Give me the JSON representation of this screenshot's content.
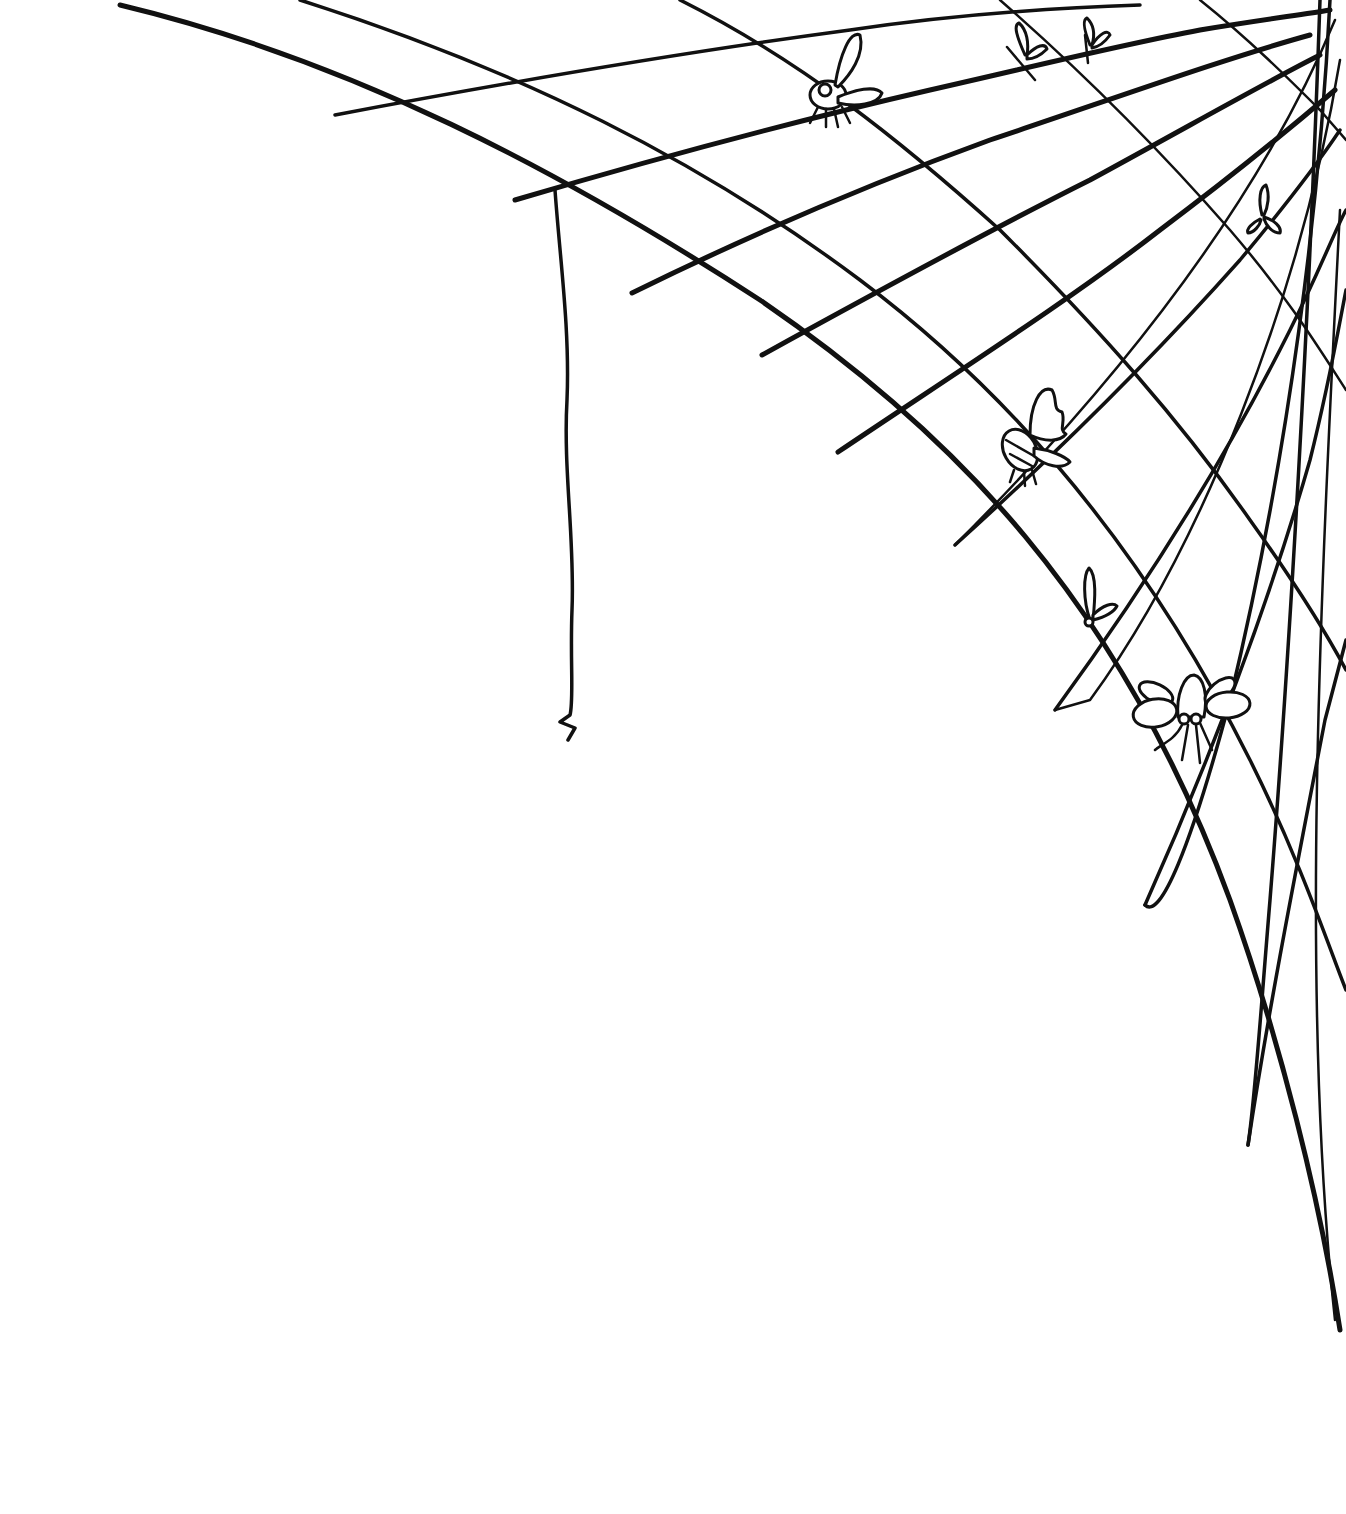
{
  "image": {
    "subject": "Hand-drawn spider web in the top-right corner with trapped insects",
    "background": "#ffffff",
    "ink": "#111111",
    "insects": [
      {
        "kind": "fly",
        "x": 840,
        "y": 85
      },
      {
        "kind": "small-fly",
        "x": 1025,
        "y": 55
      },
      {
        "kind": "small-fly",
        "x": 1090,
        "y": 45
      },
      {
        "kind": "small-fly",
        "x": 1262,
        "y": 215
      },
      {
        "kind": "bee",
        "x": 1030,
        "y": 440
      },
      {
        "kind": "small-fly",
        "x": 1095,
        "y": 600
      },
      {
        "kind": "large-fly",
        "x": 1190,
        "y": 705
      }
    ],
    "hanging_thread": {
      "x": 565,
      "y_top": 190,
      "y_bottom": 740
    }
  }
}
